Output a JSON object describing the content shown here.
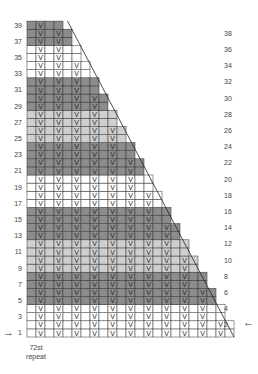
{
  "chart_data": {
    "type": "knitting-chart",
    "title": "",
    "rows": 39,
    "columns": 23,
    "stitch_symbol": "V",
    "stitch_columns_0based": "odd columns (1,3,5,...)",
    "row_width_rule": "23 columns at rows 1-2, decreasing by 1 column every 2 rows (staircase right edge with diagonal)",
    "color_bands": [
      {
        "rows": [
          37,
          39
        ],
        "color": "dark"
      },
      {
        "rows": [
          33,
          36
        ],
        "color": "white"
      },
      {
        "rows": [
          29,
          32
        ],
        "color": "dark"
      },
      {
        "rows": [
          25,
          28
        ],
        "color": "light"
      },
      {
        "rows": [
          21,
          24
        ],
        "color": "dark"
      },
      {
        "rows": [
          17,
          20
        ],
        "color": "white"
      },
      {
        "rows": [
          13,
          16
        ],
        "color": "dark"
      },
      {
        "rows": [
          9,
          12
        ],
        "color": "light"
      },
      {
        "rows": [
          5,
          8
        ],
        "color": "dark"
      },
      {
        "rows": [
          1,
          4
        ],
        "color": "white"
      }
    ],
    "left_row_labels": [
      "39",
      "37",
      "35",
      "33",
      "31",
      "29",
      "27",
      "25",
      "23",
      "21",
      "19",
      "17",
      "15",
      "13",
      "11",
      "9",
      "7",
      "5",
      "3",
      "1"
    ],
    "right_row_labels": [
      "38",
      "36",
      "34",
      "32",
      "30",
      "28",
      "26",
      "24",
      "22",
      "20",
      "18",
      "16",
      "14",
      "12",
      "10",
      "8",
      "6",
      "4",
      "2"
    ],
    "annotations": [
      "72st repeat"
    ]
  },
  "colors": {
    "dark": "#8c8c8c",
    "light": "#cfcfcf",
    "white": "#ffffff",
    "grid": "#333333"
  },
  "labels": {
    "repeat_line1": "72st",
    "repeat_line2": "repeat",
    "arrow_right": "→",
    "arrow_left": "←",
    "stitch": "V"
  }
}
